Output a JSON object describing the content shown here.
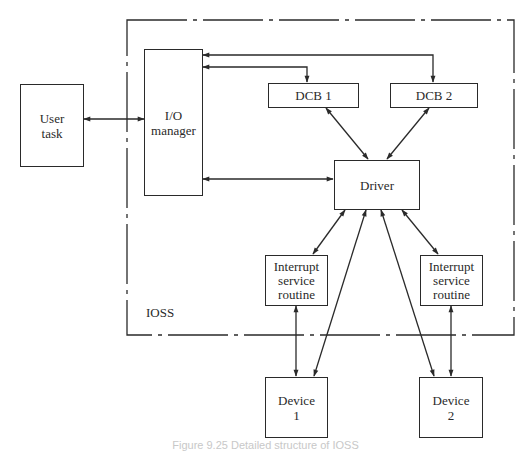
{
  "diagram": {
    "boundary_label": "IOSS",
    "nodes": {
      "user_task": "User\ntask",
      "io_manager": "I/O\nmanager",
      "dcb1": "DCB 1",
      "dcb2": "DCB 2",
      "driver": "Driver",
      "isr1": "Interrupt\nservice\nroutine",
      "isr2": "Interrupt\nservice\nroutine",
      "device1": "Device\n1",
      "device2": "Device\n2"
    },
    "edges": [
      {
        "from": "user_task",
        "to": "io_manager",
        "bidirectional": true
      },
      {
        "from": "dcb1",
        "to": "io_manager",
        "bidirectional": true
      },
      {
        "from": "dcb2",
        "to": "io_manager",
        "bidirectional": true
      },
      {
        "from": "io_manager",
        "to": "driver",
        "bidirectional": true
      },
      {
        "from": "dcb1",
        "to": "driver",
        "bidirectional": true
      },
      {
        "from": "dcb2",
        "to": "driver",
        "bidirectional": true
      },
      {
        "from": "driver",
        "to": "isr1",
        "bidirectional": true
      },
      {
        "from": "driver",
        "to": "isr2",
        "bidirectional": true
      },
      {
        "from": "driver",
        "to": "device1",
        "bidirectional": true
      },
      {
        "from": "driver",
        "to": "device2",
        "bidirectional": true
      },
      {
        "from": "isr1",
        "to": "device1",
        "bidirectional": true
      },
      {
        "from": "isr2",
        "to": "device2",
        "bidirectional": true
      }
    ],
    "caption": "Figure 9.25  Detailed structure of IOSS"
  }
}
